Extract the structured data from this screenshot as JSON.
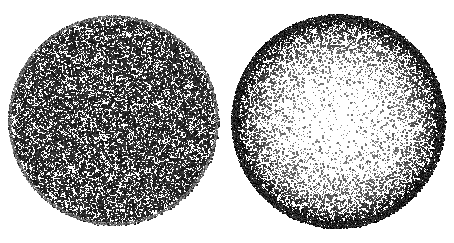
{
  "figure": {
    "title": "Comparison of uniform and limb-darkened stellar discs",
    "background_color": "#ffffff",
    "width": 454,
    "height": 243,
    "render_style": "stipple",
    "ink_color": "#000000"
  },
  "chart_data": {
    "type": "scatter",
    "title": "Comparison of uniform and limb-darkened stellar discs",
    "subtitle": "",
    "xlabel": "",
    "ylabel": "",
    "grid": false,
    "legend_position": "none",
    "axis_visible": false,
    "tick_labels": [],
    "annotations": [],
    "panels": [
      {
        "name": "uniform-disc",
        "label": "",
        "center_x": 113,
        "center_y": 120,
        "radius": 105,
        "profile": "uniform",
        "edge": "sharp",
        "point_count": 26000,
        "description": "Uniform random stipple of constant density across the entire disc; no radial brightness variation.",
        "radial_profile": {
          "r_fraction": [
            0.0,
            0.2,
            0.4,
            0.6,
            0.8,
            0.9,
            1.0
          ],
          "ink_density": [
            0.5,
            0.5,
            0.5,
            0.5,
            0.5,
            0.5,
            0.5
          ]
        },
        "dot_min_size": 1,
        "dot_max_size": 2,
        "dot_gray_min": 40,
        "dot_gray_max": 150
      },
      {
        "name": "limb-darkened-disc",
        "label": "",
        "center_x": 338,
        "center_y": 121,
        "radius": 107,
        "profile": "limb-darkened",
        "edge": "sharp",
        "point_count": 30000,
        "description": "Radially varying stipple: near-white sparse centre brightening to a dense black rim (limb darkening).",
        "radial_profile": {
          "r_fraction": [
            0.0,
            0.2,
            0.4,
            0.6,
            0.75,
            0.85,
            0.93,
            1.0
          ],
          "ink_density": [
            0.04,
            0.06,
            0.12,
            0.24,
            0.42,
            0.62,
            0.82,
            0.96
          ]
        },
        "dot_min_size": 1,
        "dot_max_size": 2,
        "dot_gray_min": 0,
        "dot_gray_max": 140
      }
    ]
  }
}
